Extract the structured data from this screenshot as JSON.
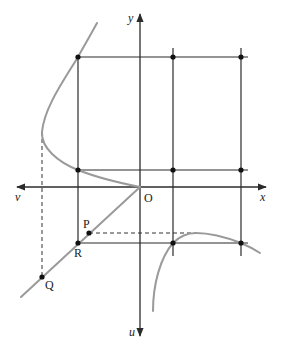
{
  "diagram": {
    "type": "graphical-construction",
    "colors": {
      "axis": "#2b2b2b",
      "grid": "#2b2b2b",
      "curve": "#9a9a9a",
      "dashed": "#333333",
      "point": "#111111"
    },
    "axes": {
      "x_label": "x",
      "y_label": "y",
      "v_label": "v",
      "u_label": "u",
      "origin_label": "O"
    },
    "points": {
      "P": "P",
      "Q": "Q",
      "R": "R"
    }
  }
}
